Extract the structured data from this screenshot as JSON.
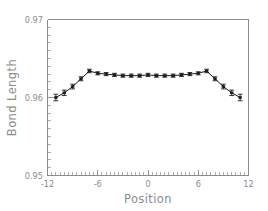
{
  "chart_data": {
    "type": "line",
    "title": "",
    "subtitle": "",
    "xlabel": "Position",
    "ylabel": "Bond  Length",
    "xlim": [
      -12,
      12
    ],
    "ylim": [
      0.95,
      0.97
    ],
    "xticks": [
      -12,
      -6,
      0,
      6,
      12
    ],
    "xtick_labels": [
      "-12",
      "-6",
      "0",
      "6",
      "12"
    ],
    "yticks": [
      0.95,
      0.96,
      0.97
    ],
    "ytick_labels": [
      "0.95",
      "0.96",
      "0.97"
    ],
    "x_minor_tick_step": 0.5,
    "y_minor_tick_step": 0.001,
    "grid": false,
    "legend": null,
    "marker": "square",
    "error_bars": true,
    "series": [
      {
        "name": "Bond Length",
        "x": [
          -11,
          -10,
          -9,
          -8,
          -7,
          -6,
          -5,
          -4,
          -3,
          -2,
          -1,
          0,
          1,
          2,
          3,
          4,
          5,
          6,
          7,
          8,
          9,
          10,
          11
        ],
        "y": [
          0.96,
          0.9606,
          0.9614,
          0.9624,
          0.9634,
          0.9631,
          0.963,
          0.9629,
          0.9628,
          0.9628,
          0.9628,
          0.9629,
          0.9628,
          0.9628,
          0.9628,
          0.9629,
          0.963,
          0.9631,
          0.9634,
          0.9624,
          0.9614,
          0.9606,
          0.96
        ],
        "yerr": [
          0.00042,
          0.00035,
          0.0003,
          0.00025,
          0.00022,
          0.0002,
          0.0002,
          0.0002,
          0.0002,
          0.0002,
          0.0002,
          0.0002,
          0.0002,
          0.0002,
          0.0002,
          0.0002,
          0.0002,
          0.0002,
          0.00022,
          0.00025,
          0.0003,
          0.00035,
          0.00042
        ]
      }
    ],
    "colors": {
      "line": "#1c1c1c",
      "axis": "#8a8a8a",
      "text": "#8c8c8c",
      "background": "#ffffff"
    }
  }
}
